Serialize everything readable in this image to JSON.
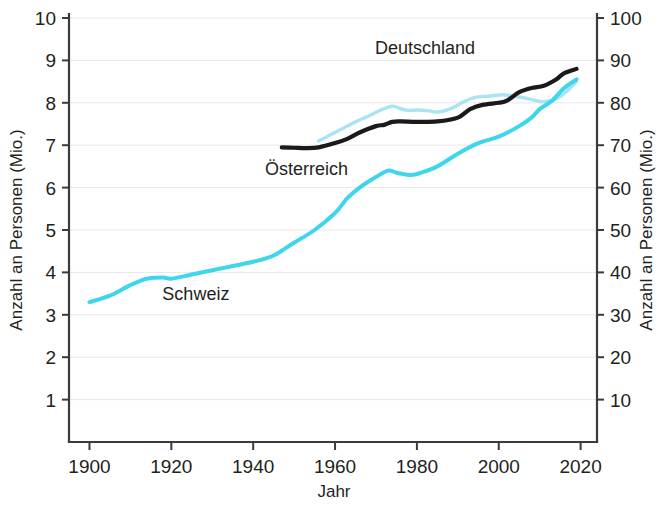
{
  "chart_data": {
    "type": "line",
    "title": "",
    "xlabel": "Jahr",
    "ylabel": "Anzahl an Personen (Mio.)",
    "ylabel_right": "Anzahl an Personen (Mio.)",
    "xlim": [
      1895,
      2024
    ],
    "ylim": [
      0,
      10
    ],
    "ylim_right": [
      0,
      100
    ],
    "xticks": [
      1900,
      1920,
      1940,
      1960,
      1980,
      2000,
      2020
    ],
    "xticklabels": [
      "1900",
      "1920",
      "1940",
      "1960",
      "1980",
      "2000",
      "2020"
    ],
    "yticks": [
      1,
      2,
      3,
      4,
      5,
      6,
      7,
      8,
      9,
      10
    ],
    "yticklabels": [
      "1",
      "2",
      "3",
      "4",
      "5",
      "6",
      "7",
      "8",
      "9",
      "10"
    ],
    "yticks_right": [
      10,
      20,
      30,
      40,
      50,
      60,
      70,
      80,
      90,
      100
    ],
    "yticklabels_right": [
      "10",
      "20",
      "30",
      "40",
      "50",
      "60",
      "70",
      "80",
      "90",
      "100"
    ],
    "grid": true,
    "grid_axis": "y",
    "legend": "inline-annotations",
    "series": [
      {
        "name": "Schweiz",
        "axis": "left",
        "color": "#3fd5eb",
        "label_x": 1926,
        "label_y": 3.35,
        "x": [
          1900,
          1905,
          1910,
          1914,
          1918,
          1920,
          1925,
          1930,
          1935,
          1940,
          1945,
          1950,
          1955,
          1960,
          1963,
          1966,
          1970,
          1973,
          1975,
          1978,
          1980,
          1985,
          1990,
          1995,
          2000,
          2005,
          2008,
          2010,
          2013,
          2016,
          2019
        ],
        "values": [
          3.3,
          3.45,
          3.7,
          3.85,
          3.88,
          3.85,
          3.95,
          4.05,
          4.15,
          4.25,
          4.4,
          4.7,
          5.0,
          5.4,
          5.75,
          6.0,
          6.25,
          6.4,
          6.35,
          6.3,
          6.32,
          6.5,
          6.8,
          7.05,
          7.2,
          7.45,
          7.65,
          7.85,
          8.05,
          8.35,
          8.55
        ]
      },
      {
        "name": "Österreich",
        "axis": "left",
        "color": "#1a1a1a",
        "label_x": 1953,
        "label_y": 6.3,
        "x": [
          1947,
          1950,
          1953,
          1956,
          1960,
          1963,
          1966,
          1970,
          1972,
          1974,
          1976,
          1980,
          1985,
          1990,
          1993,
          1996,
          2000,
          2002,
          2005,
          2008,
          2011,
          2014,
          2016,
          2019
        ],
        "values": [
          6.95,
          6.94,
          6.93,
          6.95,
          7.05,
          7.15,
          7.3,
          7.45,
          7.48,
          7.55,
          7.56,
          7.55,
          7.56,
          7.65,
          7.85,
          7.95,
          8.0,
          8.05,
          8.25,
          8.35,
          8.4,
          8.55,
          8.7,
          8.8
        ]
      },
      {
        "name": "Deutschland",
        "axis": "right",
        "color": "#a9e4f2",
        "label_x": 1982,
        "label_y": 91.5,
        "x": [
          1956,
          1959,
          1962,
          1965,
          1968,
          1971,
          1974,
          1976,
          1978,
          1980,
          1983,
          1985,
          1988,
          1991,
          1993,
          1995,
          1998,
          2001,
          2004,
          2007,
          2010,
          2012,
          2014,
          2016,
          2019
        ],
        "values": [
          71.0,
          72.5,
          74.0,
          75.5,
          76.8,
          78.2,
          79.2,
          78.6,
          78.2,
          78.3,
          78.1,
          77.8,
          78.5,
          80.0,
          80.9,
          81.4,
          81.6,
          81.9,
          81.5,
          81.0,
          80.3,
          80.4,
          80.9,
          82.2,
          85.0
        ]
      }
    ]
  },
  "axes": {
    "left_title": "Anzahl an Personen (Mio.)",
    "right_title": "Anzahl an Personen (Mio.)",
    "x_title": "Jahr"
  },
  "annotations": [
    {
      "name": "series-label-deutschland",
      "text": "Deutschland"
    },
    {
      "name": "series-label-osterreich",
      "text": "Österreich"
    },
    {
      "name": "series-label-schweiz",
      "text": "Schweiz"
    }
  ],
  "colors": {
    "schweiz": "#3fd5eb",
    "deutschland": "#a9e4f2",
    "osterreich": "#1a1a1a",
    "axis": "#3b3b3b",
    "grid": "#e9e6e6",
    "background": "#ffffff"
  }
}
